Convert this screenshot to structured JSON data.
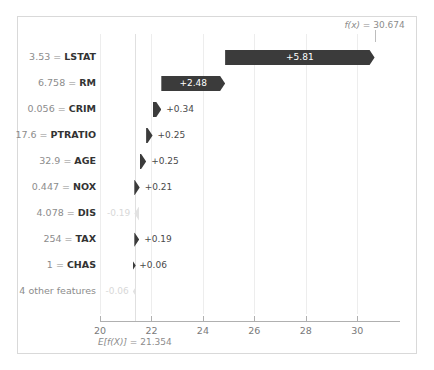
{
  "chart_data": {
    "type": "bar",
    "subtype": "shap-waterfall",
    "title": "",
    "xlabel": "",
    "ylabel": "",
    "xlim": [
      20,
      31.35
    ],
    "xticks": [
      20,
      22,
      24,
      26,
      28,
      30
    ],
    "xticklabels": [
      "20",
      "22",
      "24",
      "26",
      "28",
      "30"
    ],
    "grid": true,
    "base_value": 21.354,
    "output_value": 30.674,
    "base_annotation": "E[f(X)] = 21.354",
    "output_annotation": "f(x) = 30.674",
    "categories": [
      "3.53 = LSTAT",
      "6.758 = RM",
      "0.056 = CRIM",
      "17.6 = PTRATIO",
      "32.9 = AGE",
      "0.447 = NOX",
      "4.078 = DIS",
      "254 = TAX",
      "1 = CHAS",
      "4 other features"
    ],
    "values": [
      5.81,
      2.48,
      0.34,
      0.25,
      0.25,
      0.21,
      -0.19,
      0.19,
      0.06,
      -0.06
    ],
    "value_labels": [
      "+5.81",
      "+2.48",
      "+0.34",
      "+0.25",
      "+0.25",
      "+0.21",
      "-0.19",
      "+0.19",
      "+0.06",
      "-0.06"
    ],
    "colors": {
      "positive": "#3b3b3b",
      "negative": "#3b3b3b",
      "faint": "#e2e2e2",
      "grid": "#ededed",
      "axis": "#b0b0b0"
    }
  },
  "rows": [
    {
      "feature_value": "3.53",
      "feature_name": "LSTAT",
      "label": "3.53 = LSTAT",
      "value_label": "+5.81",
      "value": 5.81,
      "start": 24.864,
      "end": 30.674,
      "dir": "pos",
      "label_placement": "inside",
      "faint": false
    },
    {
      "feature_value": "6.758",
      "feature_name": "RM",
      "label": "6.758 = RM",
      "value_label": "+2.48",
      "value": 2.48,
      "start": 22.384,
      "end": 24.864,
      "dir": "pos",
      "label_placement": "inside",
      "faint": false
    },
    {
      "feature_value": "0.056",
      "feature_name": "CRIM",
      "label": "0.056 = CRIM",
      "value_label": "+0.34",
      "value": 0.34,
      "start": 22.044,
      "end": 22.384,
      "dir": "pos",
      "label_placement": "outside",
      "faint": false
    },
    {
      "feature_value": "17.6",
      "feature_name": "PTRATIO",
      "label": "17.6 = PTRATIO",
      "value_label": "+0.25",
      "value": 0.25,
      "start": 21.794,
      "end": 22.044,
      "dir": "pos",
      "label_placement": "outside",
      "faint": false
    },
    {
      "feature_value": "32.9",
      "feature_name": "AGE",
      "label": "32.9 = AGE",
      "value_label": "+0.25",
      "value": 0.25,
      "start": 21.544,
      "end": 21.794,
      "dir": "pos",
      "label_placement": "outside",
      "faint": false
    },
    {
      "feature_value": "0.447",
      "feature_name": "NOX",
      "label": "0.447 = NOX",
      "value_label": "+0.21",
      "value": 0.21,
      "start": 21.334,
      "end": 21.544,
      "dir": "pos",
      "label_placement": "outside",
      "faint": false
    },
    {
      "feature_value": "4.078",
      "feature_name": "DIS",
      "label": "4.078 = DIS",
      "value_label": "-0.19",
      "value": -0.19,
      "start": 21.524,
      "end": 21.334,
      "dir": "neg",
      "label_placement": "outside-left",
      "faint": true
    },
    {
      "feature_value": "254",
      "feature_name": "TAX",
      "label": "254 = TAX",
      "value_label": "+0.19",
      "value": 0.19,
      "start": 21.334,
      "end": 21.524,
      "dir": "pos",
      "label_placement": "outside",
      "faint": false
    },
    {
      "feature_value": "1",
      "feature_name": "CHAS",
      "label": "1 = CHAS",
      "value_label": "+0.06",
      "value": 0.06,
      "start": 21.274,
      "end": 21.334,
      "dir": "pos",
      "label_placement": "outside",
      "faint": false
    },
    {
      "feature_value": "",
      "feature_name": "4 other features",
      "label": "4 other features",
      "value_label": "-0.06",
      "value": -0.06,
      "start": 21.334,
      "end": 21.274,
      "dir": "neg",
      "label_placement": "outside-left",
      "faint": true
    }
  ],
  "axis": {
    "ticks": [
      "20",
      "22",
      "24",
      "26",
      "28",
      "30"
    ]
  },
  "annotations": {
    "fx": "f(x) = 30.674",
    "fx_prefix": "f(x)",
    "fx_value": " = 30.674",
    "ef_prefix": "E[f(X)]",
    "ef_value": " = 21.354"
  }
}
